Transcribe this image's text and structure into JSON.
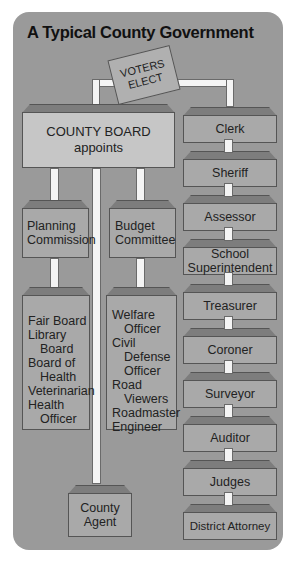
{
  "title": "A Typical County Government",
  "ballot": {
    "line1": "VOTERS",
    "line2": "ELECT"
  },
  "county_board": {
    "line1": "COUNTY BOARD",
    "line2": "appoints"
  },
  "appointed": {
    "planning": {
      "line1": "Planning",
      "line2": "Commission"
    },
    "budget": {
      "line1": "Budget",
      "line2": "Committee"
    },
    "planning_sub": [
      "Fair Board",
      "Library",
      "Board",
      "Board of",
      "Health",
      "Veterinarian",
      "Health",
      "Officer"
    ],
    "budget_sub": [
      "Welfare",
      "Officer",
      "Civil",
      "Defense",
      "Officer",
      "Road",
      "Viewers",
      "Roadmaster",
      "Engineer"
    ],
    "county_agent": {
      "line1": "County",
      "line2": "Agent"
    }
  },
  "elected": [
    {
      "line1": "Clerk",
      "line2": ""
    },
    {
      "line1": "Sheriff",
      "line2": ""
    },
    {
      "line1": "Assessor",
      "line2": ""
    },
    {
      "line1": "School",
      "line2": "Superintendent"
    },
    {
      "line1": "Treasurer",
      "line2": ""
    },
    {
      "line1": "Coroner",
      "line2": ""
    },
    {
      "line1": "Surveyor",
      "line2": ""
    },
    {
      "line1": "Auditor",
      "line2": ""
    },
    {
      "line1": "Judges",
      "line2": ""
    },
    {
      "line1": "District Attorney",
      "line2": ""
    }
  ],
  "colors": {
    "panel": "#9a9a9a",
    "box": "#a9a9a9",
    "board": "#c6c6c6",
    "connector": "#f4f4f4"
  }
}
